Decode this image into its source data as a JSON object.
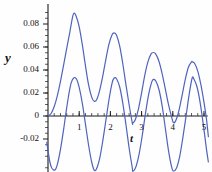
{
  "chart_data": {
    "type": "line",
    "title": "",
    "xlabel": "t",
    "ylabel": "y",
    "xlim": [
      -0.08,
      5.2
    ],
    "ylim": [
      -0.052,
      0.097
    ],
    "grid": false,
    "legend": null,
    "yticks": [
      {
        "value": 0.08,
        "label": "0.08"
      },
      {
        "value": 0.06,
        "label": "0.06"
      },
      {
        "value": 0.04,
        "label": "0.04"
      },
      {
        "value": 0.02,
        "label": "0.02"
      },
      {
        "value": 0.0,
        "label": "0"
      },
      {
        "value": -0.02,
        "label": "-0.02"
      }
    ],
    "xticks": [
      {
        "value": 1,
        "label": "1"
      },
      {
        "value": 2,
        "label": "2"
      },
      {
        "value": 3,
        "label": "3"
      },
      {
        "value": 4,
        "label": "4"
      },
      {
        "value": 5,
        "label": "5"
      }
    ],
    "minor_tick_step_x": 0.2,
    "minor_tick_step_y": 0.005,
    "series": [
      {
        "name": "upper-envelope-curve",
        "color": "#4f63bd",
        "peaks": [
          {
            "t": 0.83,
            "y": 0.0893
          },
          {
            "t": 2.12,
            "y": 0.0722
          },
          {
            "t": 3.38,
            "y": 0.0552
          },
          {
            "t": 4.62,
            "y": 0.0472
          }
        ],
        "troughs": [
          {
            "t": 0.0,
            "y": 0.0
          },
          {
            "t": 1.48,
            "y": 0.0128
          },
          {
            "t": 2.72,
            "y": -0.0062
          },
          {
            "t": 4.02,
            "y": -0.0058
          },
          {
            "t": 5.1,
            "y": -0.022
          }
        ],
        "points": [
          [
            0.0,
            0.0
          ],
          [
            0.1,
            0.0022
          ],
          [
            0.2,
            0.0082
          ],
          [
            0.3,
            0.0178
          ],
          [
            0.4,
            0.0302
          ],
          [
            0.5,
            0.0442
          ],
          [
            0.6,
            0.0588
          ],
          [
            0.7,
            0.073
          ],
          [
            0.78,
            0.0852
          ],
          [
            0.83,
            0.0893
          ],
          [
            0.9,
            0.087
          ],
          [
            1.0,
            0.0776
          ],
          [
            1.1,
            0.062
          ],
          [
            1.2,
            0.0438
          ],
          [
            1.3,
            0.0272
          ],
          [
            1.4,
            0.0164
          ],
          [
            1.48,
            0.0128
          ],
          [
            1.56,
            0.0142
          ],
          [
            1.65,
            0.0216
          ],
          [
            1.75,
            0.034
          ],
          [
            1.85,
            0.0486
          ],
          [
            1.95,
            0.062
          ],
          [
            2.05,
            0.0704
          ],
          [
            2.12,
            0.0722
          ],
          [
            2.2,
            0.07
          ],
          [
            2.3,
            0.0606
          ],
          [
            2.4,
            0.045
          ],
          [
            2.5,
            0.0268
          ],
          [
            2.6,
            0.0098
          ],
          [
            2.7,
            -0.0058
          ],
          [
            2.72,
            -0.0062
          ],
          [
            2.8,
            -0.003
          ],
          [
            2.9,
            0.0062
          ],
          [
            3.0,
            0.0202
          ],
          [
            3.1,
            0.0352
          ],
          [
            3.2,
            0.0468
          ],
          [
            3.3,
            0.0538
          ],
          [
            3.38,
            0.0552
          ],
          [
            3.45,
            0.054
          ],
          [
            3.55,
            0.048
          ],
          [
            3.65,
            0.0378
          ],
          [
            3.75,
            0.0248
          ],
          [
            3.85,
            0.0114
          ],
          [
            3.95,
            0.0004
          ],
          [
            4.02,
            -0.0058
          ],
          [
            4.1,
            -0.0036
          ],
          [
            4.2,
            0.0052
          ],
          [
            4.3,
            0.0182
          ],
          [
            4.4,
            0.0318
          ],
          [
            4.5,
            0.0424
          ],
          [
            4.6,
            0.047
          ],
          [
            4.62,
            0.0472
          ],
          [
            4.7,
            0.0456
          ],
          [
            4.8,
            0.039
          ],
          [
            4.9,
            0.0272
          ],
          [
            5.0,
            0.0118
          ],
          [
            5.08,
            -0.003
          ],
          [
            5.14,
            -0.018
          ]
        ]
      },
      {
        "name": "lower-oscillating-curve",
        "color": "#4f63bd",
        "peaks": [
          {
            "t": 0.83,
            "y": 0.0332
          },
          {
            "t": 2.12,
            "y": 0.033
          },
          {
            "t": 3.38,
            "y": 0.0318
          },
          {
            "t": 4.62,
            "y": 0.033
          }
        ],
        "troughs": [
          {
            "t": 0.22,
            "y": -0.046
          },
          {
            "t": 1.48,
            "y": -0.047
          },
          {
            "t": 2.72,
            "y": -0.048
          },
          {
            "t": 4.02,
            "y": -0.0478
          }
        ],
        "points": [
          [
            -0.04,
            -0.023
          ],
          [
            0.0,
            -0.03
          ],
          [
            0.06,
            -0.04
          ],
          [
            0.12,
            -0.0452
          ],
          [
            0.22,
            -0.047
          ],
          [
            0.3,
            -0.042
          ],
          [
            0.4,
            -0.029
          ],
          [
            0.5,
            -0.0118
          ],
          [
            0.58,
            0.0036
          ],
          [
            0.66,
            0.0176
          ],
          [
            0.74,
            0.0286
          ],
          [
            0.83,
            0.0332
          ],
          [
            0.92,
            0.0318
          ],
          [
            1.0,
            0.0248
          ],
          [
            1.1,
            0.011
          ],
          [
            1.2,
            -0.007
          ],
          [
            1.3,
            -0.0252
          ],
          [
            1.4,
            -0.04
          ],
          [
            1.48,
            -0.047
          ],
          [
            1.56,
            -0.0456
          ],
          [
            1.66,
            -0.0364
          ],
          [
            1.76,
            -0.021
          ],
          [
            1.86,
            -0.003
          ],
          [
            1.96,
            0.015
          ],
          [
            2.05,
            0.0282
          ],
          [
            2.12,
            0.033
          ],
          [
            2.2,
            0.0322
          ],
          [
            2.3,
            0.025
          ],
          [
            2.4,
            0.0108
          ],
          [
            2.5,
            -0.0078
          ],
          [
            2.6,
            -0.0278
          ],
          [
            2.7,
            -0.0448
          ],
          [
            2.72,
            -0.048
          ],
          [
            2.82,
            -0.044
          ],
          [
            2.92,
            -0.0332
          ],
          [
            3.02,
            -0.0172
          ],
          [
            3.12,
            0.0014
          ],
          [
            3.22,
            0.018
          ],
          [
            3.32,
            0.0292
          ],
          [
            3.38,
            0.0318
          ],
          [
            3.46,
            0.0302
          ],
          [
            3.56,
            0.0226
          ],
          [
            3.66,
            0.0086
          ],
          [
            3.76,
            -0.0104
          ],
          [
            3.86,
            -0.0296
          ],
          [
            3.96,
            -0.044
          ],
          [
            4.02,
            -0.0478
          ],
          [
            4.12,
            -0.0452
          ],
          [
            4.22,
            -0.0354
          ],
          [
            4.32,
            -0.0192
          ],
          [
            4.42,
            -0.001
          ],
          [
            4.52,
            0.018
          ],
          [
            4.62,
            0.033
          ],
          [
            4.68,
            0.032
          ],
          [
            4.78,
            0.025
          ],
          [
            4.88,
            0.011
          ],
          [
            4.98,
            -0.008
          ],
          [
            5.08,
            -0.029
          ],
          [
            5.14,
            -0.04
          ]
        ]
      }
    ]
  },
  "axes": {
    "y_axis_name": "y-axis",
    "x_axis_name": "t-axis"
  }
}
